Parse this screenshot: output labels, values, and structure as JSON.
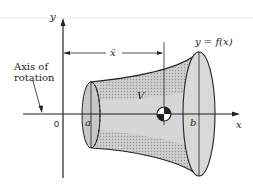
{
  "diagram": {
    "labels": {
      "y_axis": "y",
      "x_axis": "x",
      "origin": "0",
      "a": "a",
      "b": "b",
      "xbar": "x̄",
      "volume": "V",
      "curve": "y = f(x)",
      "axis_of_rotation_line1": "Axis of",
      "axis_of_rotation_line2": "rotation"
    },
    "colors": {
      "stroke": "#222222",
      "fill_light": "#d4d4d4",
      "fill_shade": "#b8b8b8"
    }
  }
}
